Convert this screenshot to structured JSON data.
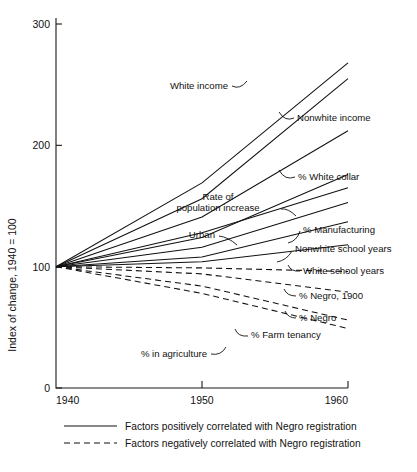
{
  "chart_data": {
    "type": "line",
    "title": "",
    "xlabel": "",
    "ylabel": "Index of change, 1940 = 100",
    "x": [
      1940,
      1950,
      1960
    ],
    "xticks": [
      "1940",
      "1950",
      "1960"
    ],
    "yticks": [
      "0",
      "100",
      "200",
      "300"
    ],
    "ylim": [
      0,
      310
    ],
    "xlim": [
      1940,
      1960
    ],
    "grid": false,
    "legend_position": "bottom",
    "base_index": 100,
    "series": [
      {
        "name": "White income",
        "correlation": "positive",
        "style": "solid",
        "values": [
          100,
          169,
          268
        ]
      },
      {
        "name": "Nonwhite income",
        "correlation": "positive",
        "style": "solid",
        "values": [
          100,
          156,
          255
        ]
      },
      {
        "name": "% White collar",
        "correlation": "positive",
        "style": "solid",
        "values": [
          100,
          141,
          212
        ]
      },
      {
        "name": "Rate of population increase",
        "correlation": "positive",
        "style": "solid",
        "values": [
          100,
          124,
          176
        ]
      },
      {
        "name": "Urban",
        "correlation": "positive",
        "style": "solid",
        "values": [
          100,
          128,
          165
        ]
      },
      {
        "name": "% Manufacturing",
        "correlation": "positive",
        "style": "solid",
        "values": [
          100,
          116,
          153
        ]
      },
      {
        "name": "Nonwhite school years",
        "correlation": "positive",
        "style": "solid",
        "values": [
          100,
          108,
          137
        ]
      },
      {
        "name": "White school years",
        "correlation": "positive",
        "style": "solid",
        "values": [
          100,
          104,
          118
        ]
      },
      {
        "name": "% Negro, 1900",
        "correlation": "negative",
        "style": "dashed",
        "values": [
          100,
          99,
          96
        ]
      },
      {
        "name": "% Negro",
        "correlation": "negative",
        "style": "dashed",
        "values": [
          100,
          94,
          79
        ]
      },
      {
        "name": "% Farm tenancy",
        "correlation": "negative",
        "style": "dashed",
        "values": [
          100,
          84,
          56
        ]
      },
      {
        "name": "% in agriculture",
        "correlation": "negative",
        "style": "dashed",
        "values": [
          100,
          78,
          49
        ]
      }
    ],
    "annotations": [
      {
        "text": "White income",
        "anchor": "end",
        "tx": 228,
        "ty": 89,
        "lx1": 232,
        "ly1": 86,
        "lx2": 247,
        "ly2": 81,
        "lcx": 240,
        "lcy": 90
      },
      {
        "text": "Nonwhite income",
        "anchor": "start",
        "tx": 297,
        "ty": 121,
        "lx1": 294,
        "ly1": 118,
        "lx2": 279,
        "ly2": 112,
        "lcx": 285,
        "lcy": 122
      },
      {
        "text": "% White collar",
        "anchor": "start",
        "tx": 298,
        "ty": 180,
        "lx1": 295,
        "ly1": 177,
        "lx2": 279,
        "ly2": 170,
        "lcx": 285,
        "lcy": 181
      },
      {
        "text": "Rate of",
        "anchor": "middle",
        "tx": 218,
        "ty": 200,
        "lx1": 0,
        "ly1": 0,
        "lx2": 0,
        "ly2": 0,
        "lcx": 0,
        "lcy": 0
      },
      {
        "text": "population increase",
        "anchor": "middle",
        "tx": 218,
        "ty": 211,
        "lx1": 281,
        "ly1": 209,
        "lx2": 296,
        "ly2": 216,
        "lcx": 288,
        "lcy": 208
      },
      {
        "text": "% Manufacturing",
        "anchor": "start",
        "tx": 303,
        "ty": 233,
        "lx1": 300,
        "ly1": 231,
        "lx2": 288,
        "ly2": 243,
        "lcx": 297,
        "lcy": 241
      },
      {
        "text": "Urban",
        "anchor": "end",
        "tx": 215,
        "ty": 238,
        "lx1": 219,
        "ly1": 236,
        "lx2": 237,
        "ly2": 245,
        "lcx": 228,
        "lcy": 237
      },
      {
        "text": "Nonwhite school years",
        "anchor": "start",
        "tx": 295,
        "ty": 252,
        "lx1": 292,
        "ly1": 251,
        "lx2": 277,
        "ly2": 262,
        "lcx": 287,
        "lcy": 260
      },
      {
        "text": "White school years",
        "anchor": "start",
        "tx": 303,
        "ty": 274,
        "lx1": 300,
        "ly1": 271,
        "lx2": 288,
        "ly2": 265,
        "lcx": 291,
        "lcy": 272
      },
      {
        "text": "% Negro, 1900",
        "anchor": "start",
        "tx": 299,
        "ty": 299,
        "lx1": 296,
        "ly1": 296,
        "lx2": 284,
        "ly2": 289,
        "lcx": 287,
        "lcy": 296
      },
      {
        "text": "% Negro",
        "anchor": "start",
        "tx": 299,
        "ty": 321,
        "lx1": 296,
        "ly1": 318,
        "lx2": 285,
        "ly2": 311,
        "lcx": 288,
        "lcy": 318
      },
      {
        "text": "% Farm tenancy",
        "anchor": "start",
        "tx": 251,
        "ty": 338,
        "lx1": 248,
        "ly1": 336,
        "lx2": 235,
        "ly2": 329,
        "lcx": 238,
        "lcy": 337
      },
      {
        "text": "% in agriculture",
        "anchor": "end",
        "tx": 207,
        "ty": 357,
        "lx1": 211,
        "ly1": 354,
        "lx2": 226,
        "ly2": 347,
        "lcx": 221,
        "lcy": 356
      }
    ],
    "legend": [
      {
        "label": "Factors positively correlated with Negro registration",
        "style": "solid"
      },
      {
        "label": "Factors negatively correlated with Negro registration",
        "style": "dashed"
      }
    ]
  },
  "colors": {
    "ink": "#111111",
    "background": "#ffffff"
  }
}
